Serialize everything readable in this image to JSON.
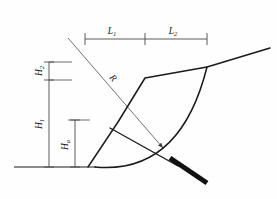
{
  "figure": {
    "background_color": "#fefefe",
    "line_color": "#1a1a1a",
    "dimension_line_color": "#4a4a4a",
    "width": 277,
    "height": 199
  },
  "labels": {
    "l1": {
      "symbol": "L",
      "subscript": "1",
      "text": "L1"
    },
    "l2": {
      "symbol": "L",
      "subscript": "2",
      "text": "L2"
    },
    "h1": {
      "symbol": "H",
      "subscript": "1",
      "text": "H1"
    },
    "h2": {
      "symbol": "H",
      "subscript": "2",
      "text": "H2"
    },
    "ha": {
      "symbol": "H",
      "subscript": "a",
      "text": "Ha"
    },
    "r": {
      "symbol": "R",
      "subscript": "",
      "text": "R"
    }
  },
  "dimensions": {
    "horizontal": {
      "baseline_y": 39,
      "ticks_x": [
        85,
        145,
        207
      ],
      "segments": [
        {
          "id": "L1",
          "from_x": 85,
          "to_x": 145,
          "label_x": 112,
          "label_y": 34
        },
        {
          "id": "L2",
          "from_x": 145,
          "to_x": 207,
          "label_x": 173,
          "label_y": 34
        }
      ]
    },
    "vertical_outer": {
      "axis_x": 49,
      "ticks_y": [
        62,
        80,
        167
      ],
      "segments": [
        {
          "id": "H2",
          "from_y": 62,
          "to_y": 80,
          "label_x": 42,
          "label_y": 71
        },
        {
          "id": "H1",
          "from_y": 80,
          "to_y": 167,
          "label_x": 42,
          "label_y": 124
        }
      ],
      "extension_lines": [
        {
          "y": 62,
          "from_x": 49,
          "to_x": 72
        },
        {
          "y": 80,
          "from_x": 49,
          "to_x": 72
        }
      ]
    },
    "vertical_inner": {
      "axis_x": 75,
      "ticks_y": [
        120,
        167
      ],
      "segments": [
        {
          "id": "Ha",
          "from_y": 120,
          "to_y": 167,
          "label_x": 68,
          "label_y": 145
        }
      ],
      "extension_lines": [
        {
          "y": 120,
          "from_x": 68,
          "to_x": 90
        }
      ]
    },
    "radius": {
      "id": "R",
      "from_x": 68,
      "from_y": 38,
      "to_x": 163,
      "to_y": 148,
      "label_x": 111,
      "label_y": 80,
      "label_rotation": 49,
      "arrowhead": true
    }
  },
  "geometry": {
    "ground_line": {
      "from_x": 14,
      "from_y": 167,
      "to_x": 96,
      "to_y": 167
    },
    "slope_profile": [
      {
        "x": 88,
        "y": 167
      },
      {
        "x": 118,
        "y": 122
      },
      {
        "x": 145,
        "y": 78
      },
      {
        "x": 207,
        "y": 67
      },
      {
        "x": 270,
        "y": 48
      }
    ],
    "slip_arc": {
      "start_x": 95,
      "start_y": 167,
      "control_x": 180,
      "control_y": 175,
      "end_x": 207,
      "end_y": 67
    },
    "inner_chord": {
      "from_x": 110,
      "from_y": 128,
      "to_x": 178,
      "to_y": 166
    },
    "blade": {
      "from_x": 170,
      "from_y": 158,
      "to_x": 207,
      "to_y": 183,
      "thickness": 5,
      "color": "#111111"
    }
  }
}
